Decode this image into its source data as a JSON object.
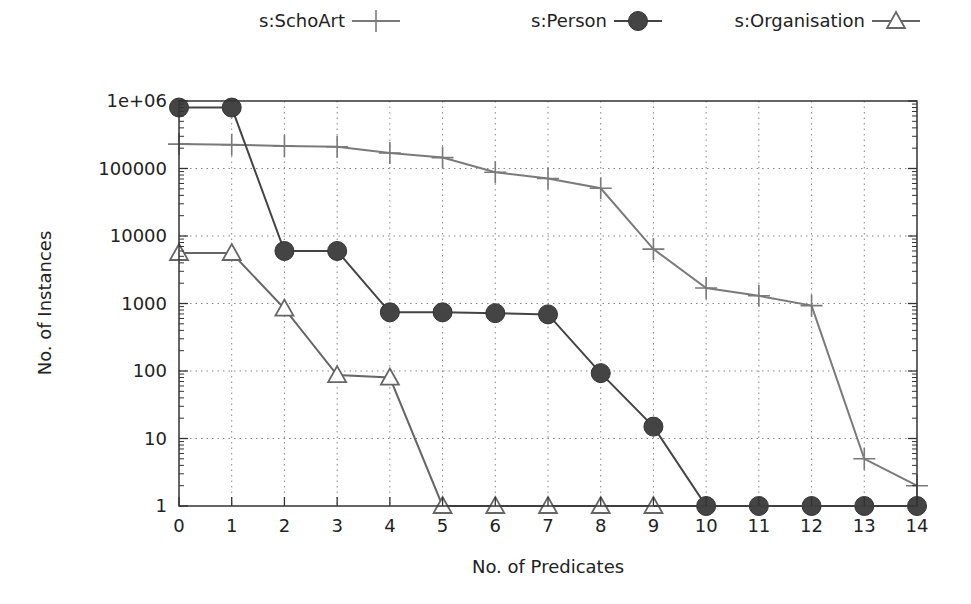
{
  "chart_data": {
    "type": "line",
    "title": "",
    "xlabel": "No. of Predicates",
    "ylabel": "No. of Instances",
    "yscale": "log",
    "ylim": [
      1,
      1000000
    ],
    "xlim": [
      0,
      14
    ],
    "grid": true,
    "legend_position": "top",
    "x": [
      0,
      1,
      2,
      3,
      4,
      5,
      6,
      7,
      8,
      9,
      10,
      11,
      12,
      13,
      14
    ],
    "x_tick_labels": [
      "0",
      "1",
      "2",
      "3",
      "4",
      "5",
      "6",
      "7",
      "8",
      "9",
      "10",
      "11",
      "12",
      "13",
      "14"
    ],
    "y_tick_labels": [
      "1",
      "10",
      "100",
      "1000",
      "10000",
      "100000",
      "1e+06"
    ],
    "y_tick_values": [
      1,
      10,
      100,
      1000,
      10000,
      100000,
      1000000
    ],
    "series": [
      {
        "name": "s:SchoArt",
        "marker": "plus",
        "color": "#7a7a7a",
        "values": [
          230000,
          225000,
          215000,
          210000,
          170000,
          145000,
          88000,
          71000,
          51000,
          6400,
          1700,
          1300,
          930,
          5,
          2
        ]
      },
      {
        "name": "s:Person",
        "marker": "filled-circle",
        "color": "#444444",
        "values": [
          800000,
          800000,
          6000,
          6000,
          740,
          740,
          720,
          690,
          93,
          15,
          1,
          1,
          1,
          1,
          1
        ]
      },
      {
        "name": "s:Organisation",
        "marker": "open-triangle",
        "color": "#666666",
        "values": [
          5600,
          5600,
          840,
          87,
          80,
          1,
          1,
          1,
          1,
          1,
          null,
          null,
          null,
          null,
          null
        ]
      }
    ]
  }
}
